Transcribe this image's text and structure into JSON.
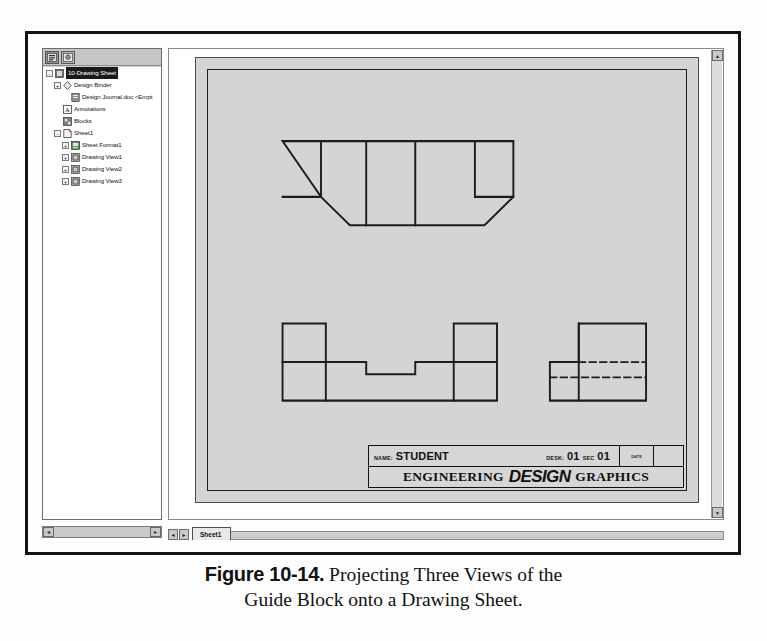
{
  "window": {
    "tree_panel": {
      "tabs": [
        {
          "name": "feature-manager-tab",
          "icon": "feature-tree-icon",
          "active": true
        },
        {
          "name": "property-manager-tab",
          "icon": "property-manager-icon",
          "active": false
        }
      ],
      "items": [
        {
          "label": "10-Drawing Sheet",
          "icon": "drawing-document-icon",
          "depth": 0,
          "expander": "-",
          "selected": true
        },
        {
          "label": "Design Binder",
          "icon": "design-binder-icon",
          "depth": 1,
          "expander": "+",
          "selected": false
        },
        {
          "label": "Design Journal.doc <Empt",
          "icon": "journal-document-icon",
          "depth": 2,
          "expander": "",
          "selected": false
        },
        {
          "label": "Annotations",
          "icon": "annotations-icon",
          "depth": 1,
          "expander": "",
          "selected": false
        },
        {
          "label": "Blocks",
          "icon": "blocks-icon",
          "depth": 1,
          "expander": "",
          "selected": false
        },
        {
          "label": "Sheet1",
          "icon": "sheet-icon",
          "depth": 1,
          "expander": "-",
          "selected": false
        },
        {
          "label": "Sheet Format1",
          "icon": "sheet-format-icon",
          "depth": 2,
          "expander": "+",
          "selected": false
        },
        {
          "label": "Drawing View1",
          "icon": "drawing-view-icon",
          "depth": 2,
          "expander": "+",
          "selected": false
        },
        {
          "label": "Drawing View2",
          "icon": "drawing-view-icon",
          "depth": 2,
          "expander": "+",
          "selected": false
        },
        {
          "label": "Drawing View3",
          "icon": "drawing-view-icon",
          "depth": 2,
          "expander": "+",
          "selected": false
        }
      ]
    },
    "tab_bar": {
      "prev_arrow": "◄",
      "next_arrow": "►",
      "sheet_tab_label": "Sheet1"
    },
    "scroll": {
      "up_arrow": "▲",
      "down_arrow": "▼",
      "left_arrow": "◄",
      "right_arrow": "►"
    }
  },
  "title_block": {
    "name_label": "NAME:",
    "name_value": "STUDENT",
    "desk_label": "DESK:",
    "desk_value": "01",
    "sec_label": "SEC",
    "sec_value": "01",
    "small_cell_text": "DATE",
    "line2_part1": "ENGINEERING",
    "line2_part2": "DESIGN",
    "line2_part3": "GRAPHICS"
  },
  "caption": {
    "figure_number": "Figure 10-14.",
    "line1": " Projecting Three Views of the",
    "line2": "Guide Block onto a Drawing Sheet."
  },
  "colors": {
    "sheet_background": "#d4d4d4",
    "line_color": "#1d1d1d",
    "window_border": "#141414",
    "panel_background": "#cfcfcf"
  },
  "drawing": {
    "views": [
      {
        "name": "top-view",
        "type": "orthographic-top",
        "description": "Trapezoidal outline with two notched ends and two vertical partition lines"
      },
      {
        "name": "front-view",
        "type": "orthographic-front",
        "description": "Channel profile with raised ends and a central rectangular notch"
      },
      {
        "name": "right-side-view",
        "type": "orthographic-right-side",
        "description": "L-shaped profile with two horizontal hidden lines"
      }
    ]
  }
}
